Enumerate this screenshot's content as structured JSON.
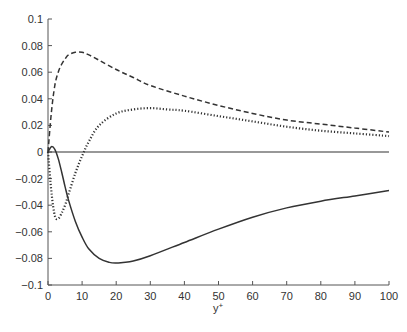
{
  "chart_data": {
    "type": "line",
    "title": "",
    "xlabel": "y+",
    "ylabel": "",
    "xlim": [
      0,
      100
    ],
    "ylim": [
      -0.1,
      0.1
    ],
    "xticks": [
      0,
      10,
      20,
      30,
      40,
      50,
      60,
      70,
      80,
      90,
      100
    ],
    "yticks": [
      0.1,
      0.08,
      0.06,
      0.04,
      0.02,
      0,
      -0.02,
      -0.04,
      -0.06,
      -0.08,
      -0.1
    ],
    "grid": false,
    "legend": null,
    "series": [
      {
        "name": "dashed",
        "style": "dashed",
        "x": [
          0,
          1,
          2,
          3,
          4,
          5,
          6,
          8,
          10,
          12,
          15,
          20,
          25,
          30,
          40,
          50,
          60,
          70,
          80,
          90,
          100
        ],
        "y": [
          0,
          0.03,
          0.05,
          0.06,
          0.066,
          0.07,
          0.073,
          0.075,
          0.075,
          0.073,
          0.069,
          0.062,
          0.056,
          0.05,
          0.042,
          0.035,
          0.029,
          0.024,
          0.021,
          0.018,
          0.015
        ]
      },
      {
        "name": "dotted",
        "style": "dotted",
        "x": [
          0,
          1,
          2,
          3,
          4,
          5,
          6,
          8,
          10,
          12,
          15,
          20,
          25,
          30,
          35,
          40,
          50,
          60,
          70,
          80,
          90,
          100
        ],
        "y": [
          0,
          -0.03,
          -0.048,
          -0.05,
          -0.046,
          -0.04,
          -0.032,
          -0.016,
          -0.003,
          0.008,
          0.02,
          0.029,
          0.032,
          0.033,
          0.032,
          0.031,
          0.027,
          0.023,
          0.019,
          0.016,
          0.014,
          0.012
        ]
      },
      {
        "name": "solid-zero",
        "style": "solid",
        "x": [
          0,
          100
        ],
        "y": [
          0,
          0
        ]
      },
      {
        "name": "solid",
        "style": "solid",
        "x": [
          0,
          1,
          2,
          3,
          4,
          5,
          6,
          8,
          10,
          12,
          15,
          18,
          20,
          22,
          25,
          30,
          40,
          50,
          60,
          70,
          80,
          90,
          100
        ],
        "y": [
          0,
          0.004,
          0.002,
          -0.005,
          -0.015,
          -0.026,
          -0.036,
          -0.052,
          -0.064,
          -0.073,
          -0.08,
          -0.083,
          -0.0835,
          -0.083,
          -0.082,
          -0.078,
          -0.068,
          -0.058,
          -0.049,
          -0.042,
          -0.037,
          -0.033,
          -0.029
        ]
      }
    ]
  }
}
